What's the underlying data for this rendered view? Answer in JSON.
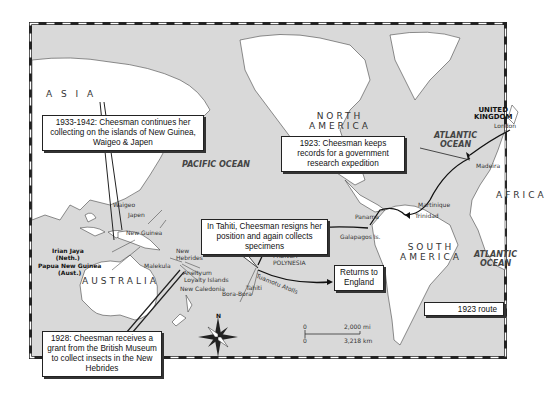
{
  "regions": {
    "asia": "A S I A",
    "north_america": "NORTH",
    "north_america_2": "AMERICA",
    "south_america": "SOUTH",
    "south_america_2": "AMERICA",
    "australia": "AUSTRALIA",
    "africa": "AFRICA",
    "united_kingdom": "UNITED",
    "united_kingdom_2": "KINGDOM"
  },
  "oceans": {
    "pacific": "PACIFIC OCEAN",
    "atlantic_north_1": "ATLANTIC",
    "atlantic_north_2": "OCEAN",
    "atlantic_south_1": "ATLANTIC",
    "atlantic_south_2": "OCEAN"
  },
  "places": {
    "london": "London",
    "madeira": "Madeira",
    "martinique": "Martinique",
    "trinidad": "Trinidad",
    "panama": "Panama",
    "galapagos": "Galapagos Is.",
    "marquesas": "Marquesas Is.",
    "french_polynesia_1": "FRENCH",
    "french_polynesia_2": "POLYNESIA",
    "tuamotu": "Tuamotu Atolls",
    "tahiti": "Tahiti",
    "bora_bora": "Bora-Bora",
    "waigeo": "Waigeo",
    "japen": "Japen",
    "new_guinea": "New Guinea",
    "irian_jaya_1": "Irian Jaya",
    "irian_jaya_2": "(Neth.)",
    "png_1": "Papua New Guinea",
    "png_2": "(Aust.)",
    "new_hebrides_1": "New",
    "new_hebrides_2": "Hebrides",
    "malekula": "Malekula",
    "aneityum": "Aneityum",
    "loyalty": "Loyalty Islands",
    "new_caledonia": "New Caledonia"
  },
  "callouts": {
    "c1933": "1933-1942: Cheesman continues her collecting on the islands of New Guinea, Waigeo & Japen",
    "c1923": "1923: Cheesman keeps records for a government research expedition",
    "tahiti": "In Tahiti, Cheesman resigns her position and again collects specimens",
    "returns": "Returns to England",
    "c1928": "1928: Cheesman receives a grant from the British Museum to collect insects in the New Hebrides"
  },
  "legend": {
    "label": "1923 route"
  },
  "compass": {
    "north": "N"
  },
  "scale": {
    "zero_mi": "0",
    "mi": "2,000 mi",
    "zero_km": "0",
    "km": "3,218 km"
  }
}
